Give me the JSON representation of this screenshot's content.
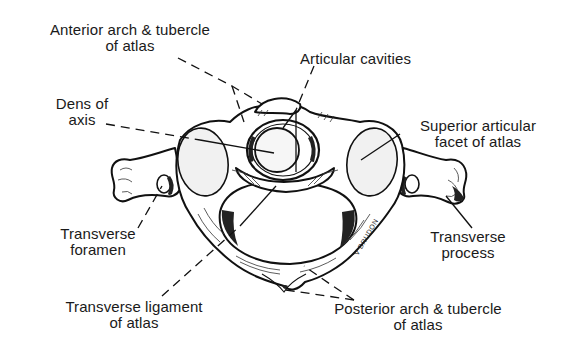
{
  "diagram": {
    "signature": "V BRUDON",
    "labels": {
      "anterior_arch": {
        "line1": "Anterior arch & tubercle",
        "line2": "of atlas"
      },
      "articular_cavities": {
        "line1": "Articular cavities"
      },
      "dens": {
        "line1": "Dens of",
        "line2": "axis"
      },
      "superior_facet": {
        "line1": "Superior articular",
        "line2": "facet of atlas"
      },
      "transverse_foramen": {
        "line1": "Transverse",
        "line2": "foramen"
      },
      "transverse_process": {
        "line1": "Transverse",
        "line2": "process"
      },
      "transverse_ligament": {
        "line1": "Transverse ligament",
        "line2": "of atlas"
      },
      "posterior_arch": {
        "line1": "Posterior arch & tubercle",
        "line2": "of atlas"
      }
    },
    "colors": {
      "background": "#ffffff",
      "ink": "#111111"
    }
  }
}
